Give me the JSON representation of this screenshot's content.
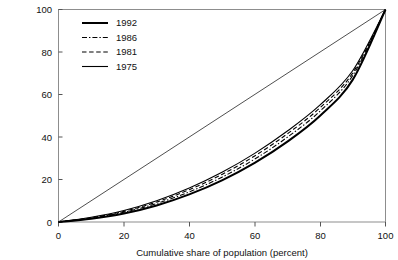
{
  "chart_data": {
    "type": "line",
    "title": "",
    "subtitle": "",
    "xlabel": "Cumulative share of population (percent)",
    "ylabel": "",
    "xlim": [
      0,
      100
    ],
    "ylim": [
      0,
      100
    ],
    "grid": false,
    "legend_position": "top-left-inset",
    "xticks": [
      "0",
      "20",
      "40",
      "60",
      "80",
      "100"
    ],
    "yticks": [
      "0",
      "20",
      "40",
      "60",
      "80",
      "100"
    ],
    "xtick_values": [
      0,
      20,
      40,
      60,
      80,
      100
    ],
    "ytick_values": [
      0,
      20,
      40,
      60,
      80,
      100
    ],
    "annotations": [
      "Lorenz curves of cumulative income share versus cumulative share of population",
      "Thin straight diagonal is the line of perfect equality"
    ],
    "x": [
      0,
      10,
      20,
      30,
      40,
      50,
      60,
      70,
      80,
      90,
      100
    ],
    "series": [
      {
        "name": "1992",
        "style": "solid-thick",
        "color": "#000000",
        "values": [
          0,
          1.5,
          4.0,
          7.8,
          13.0,
          19.6,
          27.8,
          37.8,
          50.0,
          67.0,
          100
        ]
      },
      {
        "name": "1986",
        "style": "dash-dot",
        "color": "#000000",
        "values": [
          0,
          1.8,
          4.6,
          8.7,
          14.2,
          21.1,
          29.6,
          39.9,
          52.2,
          69.0,
          100
        ]
      },
      {
        "name": "1981",
        "style": "dashed",
        "color": "#000000",
        "values": [
          0,
          2.0,
          5.0,
          9.4,
          15.2,
          22.4,
          31.1,
          41.5,
          53.8,
          70.2,
          100
        ]
      },
      {
        "name": "1975",
        "style": "solid-thin",
        "color": "#000000",
        "values": [
          0,
          2.2,
          5.4,
          10.0,
          16.0,
          23.4,
          32.3,
          42.8,
          55.1,
          71.3,
          100
        ]
      },
      {
        "name": "equality",
        "style": "solid-hairline",
        "color": "#222222",
        "values": [
          0,
          10,
          20,
          30,
          40,
          50,
          60,
          70,
          80,
          90,
          100
        ]
      }
    ]
  },
  "legend": {
    "entries": [
      {
        "label": "1992"
      },
      {
        "label": "1986"
      },
      {
        "label": "1981"
      },
      {
        "label": "1975"
      }
    ]
  }
}
